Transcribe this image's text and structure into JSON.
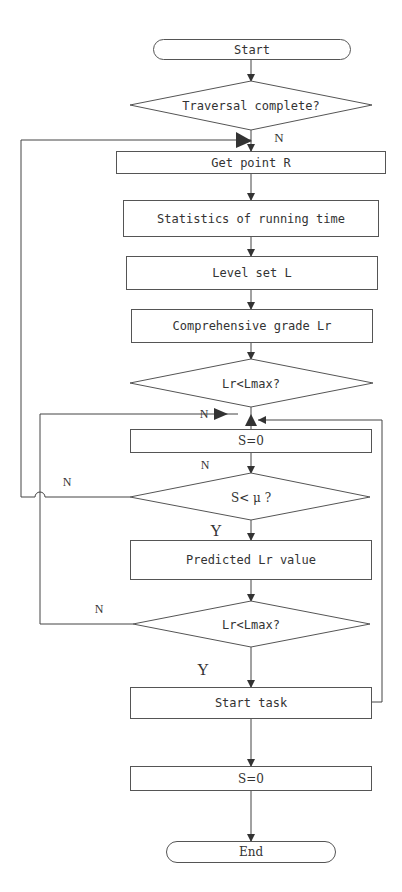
{
  "diagram": {
    "type": "flowchart",
    "nodes": {
      "start": {
        "shape": "terminator",
        "label": "Start"
      },
      "traversal": {
        "shape": "decision",
        "label": "Traversal complete?"
      },
      "get_point": {
        "shape": "process",
        "label": "Get point R"
      },
      "statistics": {
        "shape": "process",
        "label": "Statistics of running time"
      },
      "level_set": {
        "shape": "process",
        "label": "Level set L"
      },
      "grade": {
        "shape": "process",
        "label": "Comprehensive grade Lr"
      },
      "lr_check_1": {
        "shape": "decision",
        "label": "Lr<Lmax?"
      },
      "s_zero_1": {
        "shape": "process",
        "label": "S=0"
      },
      "s_check": {
        "shape": "decision",
        "label": "S< μ ?"
      },
      "predicted": {
        "shape": "process",
        "label": "Predicted Lr value"
      },
      "lr_check_2": {
        "shape": "decision",
        "label": "Lr<Lmax?"
      },
      "start_task": {
        "shape": "process",
        "label": "Start task"
      },
      "s_zero_2": {
        "shape": "process",
        "label": "S=0"
      },
      "end": {
        "shape": "terminator",
        "label": "End"
      }
    },
    "edge_labels": {
      "traversal_no": "N",
      "lr1_no": "N",
      "s_zero_no": "N",
      "s_check_no": "N",
      "s_check_yes": "Y",
      "lr2_no": "N",
      "lr2_yes": "Y"
    },
    "edges": [
      {
        "from": "start",
        "to": "traversal"
      },
      {
        "from": "traversal",
        "to": "get_point",
        "label": "N"
      },
      {
        "from": "get_point",
        "to": "statistics"
      },
      {
        "from": "statistics",
        "to": "level_set"
      },
      {
        "from": "level_set",
        "to": "grade"
      },
      {
        "from": "grade",
        "to": "lr_check_1"
      },
      {
        "from": "lr_check_1",
        "to": "s_zero_1"
      },
      {
        "from": "s_zero_1",
        "to": "s_check",
        "label": "N"
      },
      {
        "from": "s_check",
        "to": "get_point",
        "label": "N"
      },
      {
        "from": "s_check",
        "to": "predicted",
        "label": "Y"
      },
      {
        "from": "predicted",
        "to": "lr_check_2"
      },
      {
        "from": "lr_check_2",
        "to": "s_zero_1",
        "label": "N"
      },
      {
        "from": "lr_check_2",
        "to": "start_task",
        "label": "Y"
      },
      {
        "from": "start_task",
        "to": "s_zero_1"
      },
      {
        "from": "start_task",
        "to": "s_zero_2"
      },
      {
        "from": "s_zero_2",
        "to": "end"
      }
    ],
    "colors": {
      "line": "#444444",
      "text": "#333333",
      "background": "#ffffff"
    }
  }
}
